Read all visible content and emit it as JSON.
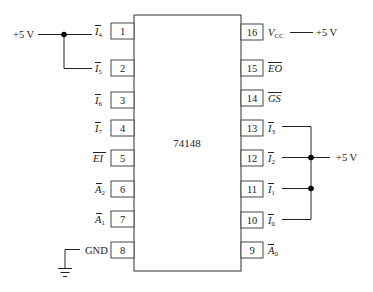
{
  "chip": {
    "name": "74148"
  },
  "supply_labels": {
    "left_top": "+5 V",
    "vcc": "+5 V",
    "right_bus": "+5 V",
    "ground": "GND"
  },
  "pins_left": [
    {
      "number": "1",
      "signal": "I",
      "sub": "4",
      "overbar": true
    },
    {
      "number": "2",
      "signal": "I",
      "sub": "5",
      "overbar": true
    },
    {
      "number": "3",
      "signal": "I",
      "sub": "6",
      "overbar": true
    },
    {
      "number": "4",
      "signal": "I",
      "sub": "7",
      "overbar": true
    },
    {
      "number": "5",
      "signal": "EI",
      "sub": "",
      "overbar": true
    },
    {
      "number": "6",
      "signal": "A",
      "sub": "2",
      "overbar": true
    },
    {
      "number": "7",
      "signal": "A",
      "sub": "1",
      "overbar": true
    },
    {
      "number": "8",
      "signal": "GND",
      "sub": "",
      "overbar": false
    }
  ],
  "pins_right": [
    {
      "number": "16",
      "signal": "V",
      "sub": "CC",
      "overbar": false
    },
    {
      "number": "15",
      "signal": "EO",
      "sub": "",
      "overbar": true
    },
    {
      "number": "14",
      "signal": "GS",
      "sub": "",
      "overbar": true
    },
    {
      "number": "13",
      "signal": "I",
      "sub": "3",
      "overbar": true
    },
    {
      "number": "12",
      "signal": "I",
      "sub": "2",
      "overbar": true
    },
    {
      "number": "11",
      "signal": "I",
      "sub": "1",
      "overbar": true
    },
    {
      "number": "10",
      "signal": "I",
      "sub": "0",
      "overbar": true
    },
    {
      "number": "9",
      "signal": "A",
      "sub": "0",
      "overbar": true
    }
  ]
}
